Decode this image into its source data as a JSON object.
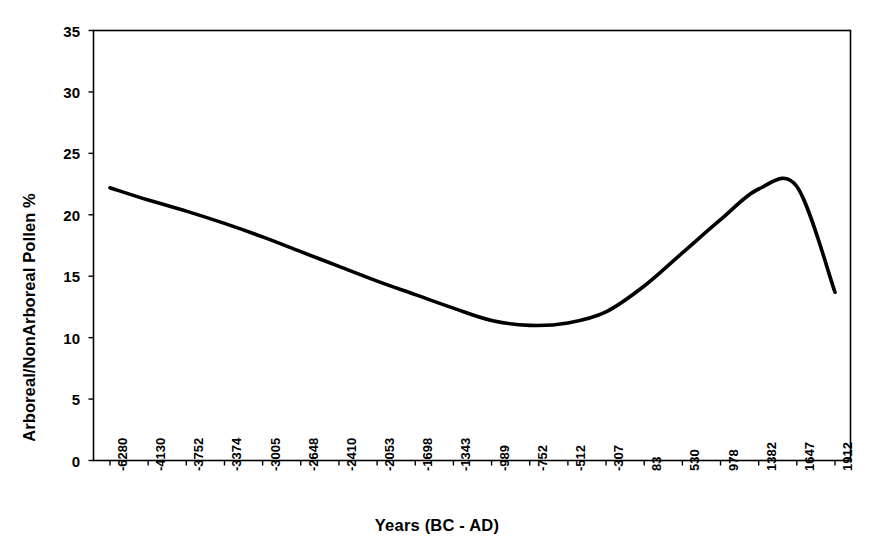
{
  "chart_data": {
    "type": "line",
    "title": "",
    "xlabel": "Years (BC - AD)",
    "ylabel": "Arboreal/NonArboreal Pollen %",
    "grid": false,
    "legend": "none",
    "ylim": [
      0,
      35
    ],
    "yticks": [
      0,
      5,
      10,
      15,
      20,
      25,
      30,
      35
    ],
    "categories": [
      "-6280",
      "-4130",
      "-3752",
      "-3374",
      "-3005",
      "-2648",
      "-2410",
      "-2053",
      "-1698",
      "-1343",
      "-989",
      "-752",
      "-512",
      "-307",
      "83",
      "530",
      "978",
      "1382",
      "1647",
      "1912"
    ],
    "series": [
      {
        "name": "Arboreal/NonArboreal Pollen %",
        "color": "#000000",
        "values": [
          22.2,
          21.2,
          20.3,
          19.3,
          18.2,
          17.0,
          15.8,
          14.6,
          13.5,
          12.4,
          11.4,
          11.0,
          11.2,
          12.1,
          14.2,
          16.9,
          19.6,
          22.1,
          22.3,
          13.7
        ]
      }
    ]
  },
  "axes": {
    "x_tick_labels": [
      "-6280",
      "-4130",
      "-3752",
      "-3374",
      "-3005",
      "-2648",
      "-2410",
      "-2053",
      "-1698",
      "-1343",
      "-989",
      "-752",
      "-512",
      "-307",
      "83",
      "530",
      "978",
      "1382",
      "1647",
      "1912"
    ],
    "y_tick_labels": [
      "0",
      "5",
      "10",
      "15",
      "20",
      "25",
      "30",
      "35"
    ],
    "x_title": "Years (BC - AD)",
    "y_title": "Arboreal/NonArboreal Pollen %"
  },
  "style": {
    "line_color": "#111111",
    "axis_color": "#000000",
    "plot_background": "#ffffff",
    "page_background": "#ffffff"
  }
}
